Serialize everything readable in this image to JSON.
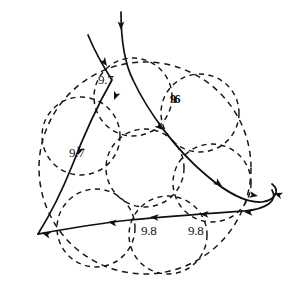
{
  "figure": {
    "name": "dashed-circle-packing-with-flow-curves",
    "background_color": "#ffffff",
    "stroke_color": "#101010",
    "width": 295,
    "height": 295
  },
  "outer_circle": {
    "name": "outer-boundary-circle",
    "cx": 145,
    "cy": 168,
    "r": 106,
    "style": "dashed"
  },
  "inner_circles": [
    {
      "name": "circle-center",
      "cx": 145,
      "cy": 168,
      "r": 39
    },
    {
      "name": "circle-upper-left",
      "cx": 81,
      "cy": 136,
      "r": 39
    },
    {
      "name": "circle-top",
      "cx": 133,
      "cy": 97,
      "r": 39
    },
    {
      "name": "circle-upper-right",
      "cx": 200,
      "cy": 113,
      "r": 39
    },
    {
      "name": "circle-right",
      "cx": 212,
      "cy": 183,
      "r": 39
    },
    {
      "name": "circle-lower-right",
      "cx": 168,
      "cy": 235,
      "r": 39
    },
    {
      "name": "circle-lower-left",
      "cx": 96,
      "cy": 228,
      "r": 39
    }
  ],
  "labels": [
    {
      "name": "label-upper-9-7",
      "text": "9.7",
      "x": 98,
      "y": 73,
      "style": "plain"
    },
    {
      "name": "label-smudged-9-6",
      "text": "9.6",
      "x": 170,
      "y": 93,
      "style": "smudged"
    },
    {
      "name": "label-left-9-7",
      "text": "9.7",
      "x": 69,
      "y": 146,
      "style": "plain"
    },
    {
      "name": "label-bottom-9-8",
      "text": "9.8",
      "x": 141,
      "y": 224,
      "style": "plain"
    },
    {
      "name": "label-right-9-8",
      "text": "9.8",
      "x": 188,
      "y": 224,
      "style": "plain"
    }
  ],
  "curves": [
    {
      "name": "curve-vertical-descending",
      "description": "near-vertical curve entering from top, bending right and sweeping down across the packing to the lower right loop",
      "path": "M 121 12 C 121 38, 124 62, 133 80 C 148 112, 176 150, 206 175 C 228 194, 248 203, 262 202 C 276 200, 280 190, 272 184"
    },
    {
      "name": "curve-diagonal-descending",
      "description": "curve entering from upper left, crossing the packing diagonally and exiting toward the lower left cusp",
      "path": "M 88 35 C 95 52, 103 66, 112 80 C 96 108, 82 140, 72 166 C 60 196, 48 218, 38 234"
    },
    {
      "name": "curve-lower-horizontal",
      "description": "long near-horizontal curve from the left cusp sweeping right and curling into the right-hand loop",
      "path": "M 38 234 C 60 230, 92 224, 130 220 C 172 216, 216 213, 244 211 C 268 209, 278 200, 272 190"
    }
  ],
  "arrow_marks": [
    {
      "name": "arrow-top-vertical",
      "x": 121,
      "y": 30,
      "angle": 90
    },
    {
      "name": "arrow-top-diagonal",
      "x": 107,
      "y": 66,
      "angle": 55
    },
    {
      "name": "arrow-mid-upper-left",
      "x": 114,
      "y": 100,
      "angle": 112
    },
    {
      "name": "arrow-mid-left",
      "x": 78,
      "y": 155,
      "angle": 110
    },
    {
      "name": "arrow-center-right",
      "x": 163,
      "y": 130,
      "angle": 42
    },
    {
      "name": "arrow-right-upper",
      "x": 222,
      "y": 186,
      "angle": 35
    },
    {
      "name": "arrow-right-loop-top",
      "x": 258,
      "y": 196,
      "angle": 10
    },
    {
      "name": "arrow-right-loop-end",
      "x": 274,
      "y": 193,
      "angle": 200
    },
    {
      "name": "arrow-bottom-right",
      "x": 244,
      "y": 212,
      "angle": 182
    },
    {
      "name": "arrow-bottom-mid-right",
      "x": 200,
      "y": 214,
      "angle": 183
    },
    {
      "name": "arrow-bottom-mid",
      "x": 150,
      "y": 217,
      "angle": 184
    },
    {
      "name": "arrow-bottom-left",
      "x": 108,
      "y": 222,
      "angle": 187
    },
    {
      "name": "arrow-left-cusp",
      "x": 42,
      "y": 233,
      "angle": 196
    }
  ]
}
